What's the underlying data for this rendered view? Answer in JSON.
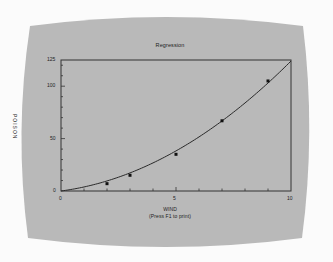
{
  "colors": {
    "page_background": "#fbfbfb",
    "screen_background": "#b9b9b9",
    "axis_color": "#333333",
    "curve_color": "#2a2a2a",
    "point_color": "#111111",
    "text_color": "#222222"
  },
  "chart": {
    "title": "Regression",
    "xlabel": "WIND",
    "xlabel_note": "(Press F1 to print)",
    "ylabel": "POISON",
    "x_ticks": [
      "0",
      "5",
      "10"
    ],
    "y_ticks": [
      "0",
      "50",
      "100",
      "125"
    ]
  },
  "chart_data": {
    "type": "scatter",
    "title": "Regression",
    "xlabel": "WIND",
    "ylabel": "POISON",
    "subtitle": "(Press F1 to print)",
    "xlim": [
      0,
      10
    ],
    "ylim": [
      0,
      125
    ],
    "x_tick_labels": [
      "0",
      "5",
      "10"
    ],
    "y_tick_labels": [
      "0",
      "50",
      "100",
      "125"
    ],
    "x_minor_ticks": [
      1,
      2,
      3,
      4,
      6,
      7,
      8,
      9
    ],
    "grid": false,
    "legend": null,
    "series": [
      {
        "name": "observed",
        "kind": "points",
        "x": [
          2,
          3,
          5,
          7,
          9
        ],
        "y": [
          7,
          15,
          35,
          67,
          105
        ]
      },
      {
        "name": "regression fit",
        "kind": "curve",
        "x": [
          0,
          1,
          2,
          3,
          4,
          5,
          6,
          7,
          8,
          9,
          10
        ],
        "y": [
          0,
          1.5,
          6.5,
          14,
          24,
          35.5,
          50,
          66,
          84,
          104,
          125
        ]
      }
    ]
  }
}
